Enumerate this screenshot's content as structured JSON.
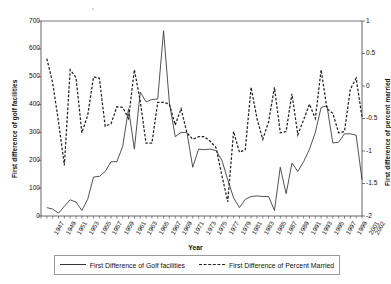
{
  "axes": {
    "x_title": "Year",
    "y_left_title": "First difference of golf facilities",
    "y_right_title": "First difference of percent married",
    "y_left_ticks": [
      "700",
      "600",
      "500",
      "400",
      "300",
      "200",
      "100",
      "0"
    ],
    "y_right_ticks": [
      "1",
      "0.5",
      "0",
      "-0.5",
      "-1",
      "-1.5",
      "-2"
    ],
    "x_ticks": [
      "1947",
      "1949",
      "1951",
      "1953",
      "1955",
      "1957",
      "1959",
      "1961",
      "1963",
      "1965",
      "1967",
      "1969",
      "1971",
      "1973",
      "1975",
      "1977",
      "1979",
      "1981",
      "1983",
      "1985",
      "1987",
      "1989",
      "1991",
      "1993",
      "1995",
      "1997",
      "1999",
      "2001",
      "2002"
    ]
  },
  "legend": {
    "items": [
      {
        "label": "First Difference of Golf facilities",
        "style": "solid"
      },
      {
        "label": "First Difference of Percent Married",
        "style": "dashed"
      }
    ]
  },
  "colors": {
    "line_golf": "#333333",
    "line_married": "#222222",
    "axis": "#555555",
    "text": "#111111"
  },
  "chart_data": {
    "type": "line",
    "title": "",
    "xlabel": "Year",
    "ylabel": "First difference of golf facilities",
    "ylabel_secondary": "First difference of percent married",
    "xlim": [
      1947,
      2002
    ],
    "ylim": [
      0,
      700
    ],
    "ylim_secondary": [
      -2,
      1
    ],
    "grid": false,
    "legend_position": "bottom",
    "x": [
      1947,
      1948,
      1949,
      1950,
      1951,
      1952,
      1953,
      1954,
      1955,
      1956,
      1957,
      1958,
      1959,
      1960,
      1961,
      1962,
      1963,
      1964,
      1965,
      1966,
      1967,
      1968,
      1969,
      1970,
      1971,
      1972,
      1973,
      1974,
      1975,
      1976,
      1977,
      1978,
      1979,
      1980,
      1981,
      1982,
      1983,
      1984,
      1985,
      1986,
      1987,
      1988,
      1989,
      1990,
      1991,
      1992,
      1993,
      1994,
      1995,
      1996,
      1997,
      1998,
      1999,
      2000,
      2001,
      2002
    ],
    "series": [
      {
        "name": "First Difference of Golf facilities",
        "axis": "left",
        "style": "solid",
        "values": [
          null,
          30,
          25,
          10,
          35,
          58,
          50,
          20,
          60,
          140,
          142,
          160,
          195,
          195,
          250,
          385,
          240,
          445,
          410,
          418,
          420,
          665,
          405,
          285,
          300,
          300,
          175,
          240,
          238,
          240,
          235,
          200,
          130,
          65,
          30,
          60,
          70,
          72,
          70,
          70,
          20,
          175,
          80,
          190,
          160,
          195,
          240,
          300,
          390,
          395,
          262,
          265,
          295,
          295,
          290,
          130
        ]
      },
      {
        "name": "First Difference of Percent Married",
        "axis": "right",
        "style": "dashed",
        "values": [
          null,
          0.42,
          0.05,
          -0.55,
          -1.22,
          0.25,
          0.13,
          -0.72,
          -0.45,
          0.14,
          0.12,
          -0.62,
          -0.58,
          -0.32,
          -0.33,
          -0.5,
          0.25,
          -0.23,
          -0.88,
          -0.88,
          -0.25,
          -0.25,
          -0.28,
          -0.6,
          -0.35,
          -0.72,
          -0.82,
          -0.78,
          -0.78,
          -0.85,
          -0.95,
          -1.38,
          -1.78,
          -0.7,
          -1.02,
          -0.98,
          -0.02,
          -0.5,
          -0.82,
          -0.55,
          -0.02,
          -0.72,
          -0.7,
          -0.12,
          -0.75,
          -0.52,
          -0.28,
          -0.5,
          0.25,
          -0.35,
          -0.42,
          -0.72,
          -0.7,
          -0.05,
          0.12,
          -0.48
        ]
      }
    ]
  }
}
